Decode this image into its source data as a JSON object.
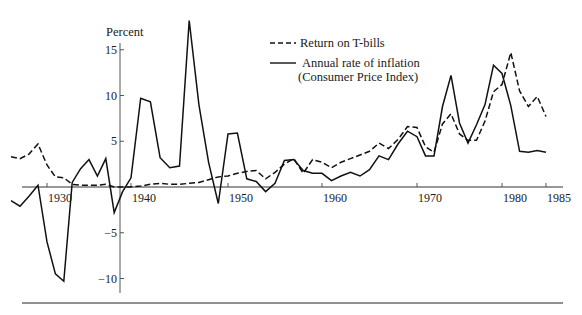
{
  "chart_data": {
    "type": "line",
    "title": "",
    "ylabel": "Percent",
    "xlabel": "",
    "ylim": [
      -11,
      18
    ],
    "xlim": [
      1926,
      1986
    ],
    "grid": false,
    "legend_position": "top-center",
    "x_ticks": [
      {
        "year": 1930,
        "label": "1930"
      },
      {
        "year": 1940,
        "label": "1940"
      },
      {
        "year": 1950,
        "label": "1950"
      },
      {
        "year": 1960,
        "label": "1960"
      },
      {
        "year": 1970,
        "label": "1970"
      },
      {
        "year": 1980,
        "label": "1980"
      },
      {
        "year": 1985,
        "label": "1985"
      }
    ],
    "y_ticks": [
      {
        "value": 15,
        "label": "15"
      },
      {
        "value": 10,
        "label": "10"
      },
      {
        "value": 5,
        "label": "5"
      },
      {
        "value": -5,
        "label": "−5"
      },
      {
        "value": -10,
        "label": "−10"
      }
    ],
    "series": [
      {
        "name": "Return on T-bills",
        "style": "dashed",
        "x": [
          1926,
          1927,
          1928,
          1929,
          1930,
          1931,
          1932,
          1933,
          1934,
          1935,
          1936,
          1937,
          1938,
          1939,
          1940,
          1941,
          1942,
          1943,
          1944,
          1945,
          1946,
          1947,
          1948,
          1949,
          1950,
          1951,
          1952,
          1953,
          1954,
          1955,
          1956,
          1957,
          1958,
          1959,
          1960,
          1961,
          1962,
          1963,
          1964,
          1965,
          1966,
          1967,
          1968,
          1969,
          1970,
          1971,
          1972,
          1973,
          1974,
          1975,
          1976,
          1977,
          1978,
          1979,
          1980,
          1981,
          1982,
          1983,
          1984,
          1985
        ],
        "values": [
          3.3,
          3.1,
          3.6,
          4.7,
          2.4,
          1.1,
          1.0,
          0.3,
          0.2,
          0.2,
          0.2,
          0.3,
          0.0,
          0.0,
          0.0,
          0.1,
          0.3,
          0.4,
          0.3,
          0.3,
          0.4,
          0.5,
          0.8,
          1.1,
          1.2,
          1.5,
          1.7,
          1.8,
          0.9,
          1.6,
          2.5,
          3.1,
          1.5,
          3.0,
          2.7,
          2.1,
          2.7,
          3.1,
          3.5,
          3.9,
          4.8,
          4.2,
          5.2,
          6.6,
          6.5,
          4.4,
          3.8,
          6.9,
          8.0,
          5.8,
          5.1,
          5.1,
          7.2,
          10.4,
          11.2,
          14.7,
          10.5,
          8.8,
          9.9,
          7.7
        ]
      },
      {
        "name": "Annual rate of inflation (Consumer Price Index)",
        "style": "solid",
        "x": [
          1926,
          1927,
          1928,
          1929,
          1930,
          1931,
          1932,
          1933,
          1934,
          1935,
          1936,
          1937,
          1938,
          1939,
          1940,
          1941,
          1942,
          1943,
          1944,
          1945,
          1946,
          1947,
          1948,
          1949,
          1950,
          1951,
          1952,
          1953,
          1954,
          1955,
          1956,
          1957,
          1958,
          1959,
          1960,
          1961,
          1962,
          1963,
          1964,
          1965,
          1966,
          1967,
          1968,
          1969,
          1970,
          1971,
          1972,
          1973,
          1974,
          1975,
          1976,
          1977,
          1978,
          1979,
          1980,
          1981,
          1982,
          1983,
          1984,
          1985
        ],
        "values": [
          -1.5,
          -2.1,
          -1.0,
          0.2,
          -6.0,
          -9.5,
          -10.3,
          0.5,
          2.0,
          3.0,
          1.2,
          3.1,
          -2.8,
          -0.5,
          1.0,
          9.7,
          9.3,
          3.2,
          2.1,
          2.3,
          18.2,
          9.0,
          2.7,
          -1.8,
          5.8,
          5.9,
          0.9,
          0.6,
          -0.5,
          0.4,
          2.9,
          3.0,
          1.8,
          1.5,
          1.5,
          0.7,
          1.2,
          1.6,
          1.2,
          1.9,
          3.4,
          3.0,
          4.7,
          6.1,
          5.5,
          3.4,
          3.4,
          8.8,
          12.2,
          7.0,
          4.8,
          6.8,
          9.0,
          13.3,
          12.4,
          8.9,
          3.9,
          3.8,
          4.0,
          3.8
        ]
      }
    ],
    "legend": [
      {
        "label": "Return on T-bills",
        "style": "dashed"
      },
      {
        "label_line1": "Annual rate of inflation",
        "label_line2": "(Consumer Price Index)",
        "style": "solid"
      }
    ]
  },
  "axis": {
    "y_title": "Percent"
  }
}
